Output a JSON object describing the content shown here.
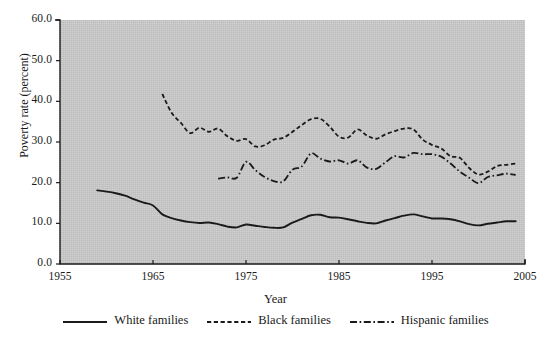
{
  "chart_data": {
    "type": "line",
    "title": "",
    "xlabel": "Year",
    "ylabel": "Poverty rate (percent)",
    "xlim": [
      1955,
      2005
    ],
    "ylim": [
      0.0,
      60.0
    ],
    "xticks": [
      1955,
      1965,
      1975,
      1985,
      1995,
      2005
    ],
    "xtick_labels": [
      "1955",
      "1965",
      "1975",
      "1985",
      "1995",
      "2005"
    ],
    "yticks": [
      0.0,
      10.0,
      20.0,
      30.0,
      40.0,
      50.0,
      60.0
    ],
    "ytick_labels": [
      "0.0",
      "10.0",
      "20.0",
      "30.0",
      "40.0",
      "50.0",
      "60.0"
    ],
    "grid": false,
    "legend_position": "below",
    "plot_background": "#cacaca",
    "series": [
      {
        "name": "White families",
        "style": "solid",
        "color": "#1a1a1a",
        "x": [
          1959,
          1960,
          1961,
          1962,
          1963,
          1964,
          1965,
          1966,
          1967,
          1968,
          1969,
          1970,
          1971,
          1972,
          1973,
          1974,
          1975,
          1976,
          1977,
          1978,
          1979,
          1980,
          1981,
          1982,
          1983,
          1984,
          1985,
          1986,
          1987,
          1988,
          1989,
          1990,
          1991,
          1992,
          1993,
          1994,
          1995,
          1996,
          1997,
          1998,
          1999,
          2000,
          2001,
          2002,
          2003,
          2004
        ],
        "y": [
          18.1,
          17.8,
          17.4,
          16.8,
          15.9,
          15.1,
          14.4,
          12.2,
          11.3,
          10.7,
          10.3,
          10.1,
          10.2,
          9.8,
          9.2,
          9.0,
          9.7,
          9.4,
          9.1,
          8.9,
          9.0,
          10.2,
          11.1,
          12.0,
          12.1,
          11.5,
          11.4,
          11.0,
          10.5,
          10.1,
          10.0,
          10.7,
          11.3,
          11.9,
          12.2,
          11.7,
          11.2,
          11.2,
          11.0,
          10.5,
          9.8,
          9.5,
          9.9,
          10.2,
          10.5,
          10.5
        ]
      },
      {
        "name": "Black families",
        "style": "dashed",
        "color": "#1a1a1a",
        "x": [
          1966,
          1967,
          1968,
          1969,
          1970,
          1971,
          1972,
          1973,
          1974,
          1975,
          1976,
          1977,
          1978,
          1979,
          1980,
          1981,
          1982,
          1983,
          1984,
          1985,
          1986,
          1987,
          1988,
          1989,
          1990,
          1991,
          1992,
          1993,
          1994,
          1995,
          1996,
          1997,
          1998,
          1999,
          2000,
          2001,
          2002,
          2003,
          2004
        ],
        "y": [
          41.8,
          37.2,
          34.7,
          32.2,
          33.5,
          32.5,
          33.3,
          31.4,
          30.3,
          30.7,
          28.9,
          29.2,
          30.6,
          31.0,
          32.5,
          34.2,
          35.6,
          35.7,
          33.8,
          31.3,
          31.1,
          33.1,
          31.6,
          30.8,
          31.9,
          32.7,
          33.3,
          33.1,
          30.6,
          29.3,
          28.4,
          26.5,
          26.1,
          23.6,
          22.0,
          22.7,
          24.1,
          24.4,
          24.7
        ]
      },
      {
        "name": "Hispanic families",
        "style": "dashdot",
        "color": "#1a1a1a",
        "x": [
          1972,
          1973,
          1974,
          1975,
          1976,
          1977,
          1978,
          1979,
          1980,
          1981,
          1982,
          1983,
          1984,
          1985,
          1986,
          1987,
          1988,
          1989,
          1990,
          1991,
          1992,
          1993,
          1994,
          1995,
          1996,
          1997,
          1998,
          1999,
          2000,
          2001,
          2002,
          2003,
          2004
        ],
        "y": [
          21.0,
          21.3,
          21.2,
          25.1,
          23.1,
          21.4,
          20.4,
          20.3,
          23.2,
          24.0,
          27.2,
          25.9,
          25.2,
          25.5,
          24.7,
          25.5,
          23.7,
          23.4,
          25.0,
          26.5,
          26.2,
          27.3,
          27.0,
          27.0,
          26.4,
          24.7,
          22.7,
          21.2,
          19.9,
          21.4,
          21.8,
          22.2,
          21.9
        ]
      }
    ]
  }
}
